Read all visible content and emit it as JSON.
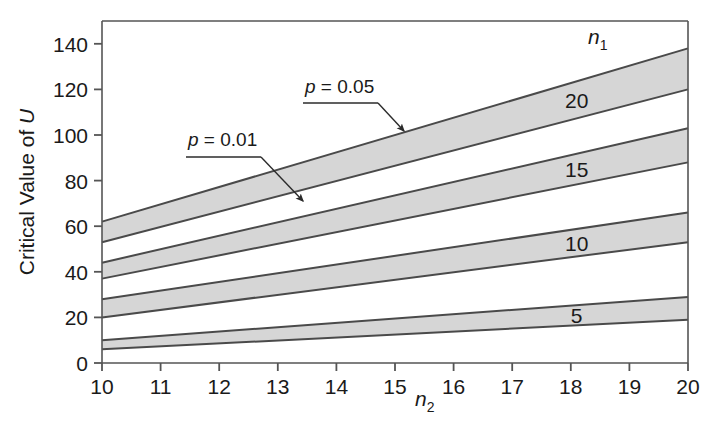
{
  "chart_data": {
    "type": "area",
    "title": "",
    "xlabel": "n2",
    "ylabel": "Critical Value of U",
    "xlabel_display": "n",
    "xlabel_sub": "2",
    "ylabel_display": "Critical Value of ",
    "ylabel_italic": "U",
    "xlim": [
      10,
      20
    ],
    "ylim": [
      0,
      150
    ],
    "grid": false,
    "legend": "inline-band-labels",
    "xticks": [
      10,
      11,
      12,
      13,
      14,
      15,
      16,
      17,
      18,
      19,
      20
    ],
    "yticks": [
      0,
      20,
      40,
      60,
      80,
      100,
      120,
      140
    ],
    "band_fill_color": "#d6d6d6",
    "line_color": "#4a4a4a",
    "axis_color": "#555555",
    "background_color": "#ffffff",
    "band_group_label": "n1",
    "band_group_label_display": "n",
    "band_group_label_sub": "1",
    "series": [
      {
        "name": "20",
        "label": "20",
        "n1": 20,
        "upper_bound_name": "p = 0.05",
        "lower_bound_name": "p = 0.01",
        "x": [
          10,
          20
        ],
        "upper": [
          62,
          138
        ],
        "lower": [
          53,
          120
        ]
      },
      {
        "name": "15",
        "label": "15",
        "n1": 15,
        "upper_bound_name": "p = 0.05",
        "lower_bound_name": "p = 0.01",
        "x": [
          10,
          20
        ],
        "upper": [
          44,
          103
        ],
        "lower": [
          37,
          88
        ]
      },
      {
        "name": "10",
        "label": "10",
        "n1": 10,
        "upper_bound_name": "p = 0.05",
        "lower_bound_name": "p = 0.01",
        "x": [
          10,
          20
        ],
        "upper": [
          28,
          66
        ],
        "lower": [
          20,
          53
        ]
      },
      {
        "name": "5",
        "label": "5",
        "n1": 5,
        "upper_bound_name": "p = 0.05",
        "lower_bound_name": "p = 0.01",
        "x": [
          10,
          20
        ],
        "upper": [
          10,
          29
        ],
        "lower": [
          6,
          19
        ]
      }
    ],
    "annotations": [
      {
        "id": "p005",
        "text": "p = 0.05",
        "text_italic": "p",
        "text_rest": " = 0.05",
        "label_x": 305,
        "label_y": 93,
        "arrow_from_x": 378,
        "arrow_from_y": 103,
        "arrow_to_x": 404,
        "arrow_to_y": 131
      },
      {
        "id": "p001",
        "text": "p = 0.01",
        "text_italic": "p",
        "text_rest": " = 0.01",
        "label_x": 188,
        "label_y": 146,
        "arrow_from_x": 261,
        "arrow_from_y": 157,
        "arrow_to_x": 303,
        "arrow_to_y": 201
      }
    ]
  },
  "axis": {
    "y_tick_labels": [
      "140",
      "120",
      "100",
      "80",
      "60",
      "40",
      "20",
      "0"
    ],
    "x_tick_labels": [
      "10",
      "11",
      "12",
      "13",
      "14",
      "15",
      "16",
      "17",
      "18",
      "19",
      "20"
    ]
  }
}
